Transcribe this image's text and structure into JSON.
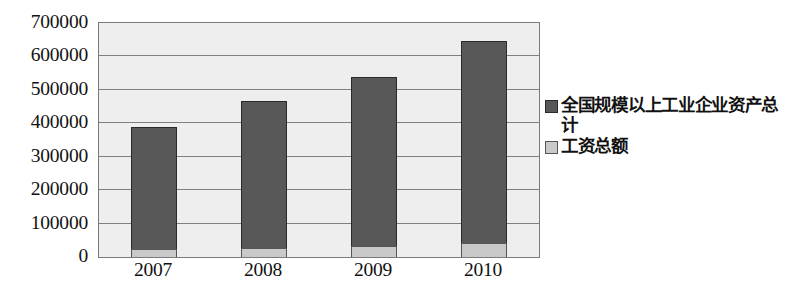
{
  "chart_data": {
    "type": "bar",
    "subtype": "stacked-column",
    "title": "",
    "subtitle": "",
    "xlabel": "",
    "ylabel": "",
    "categories": [
      "2007",
      "2008",
      "2009",
      "2010"
    ],
    "series": [
      {
        "name": "工资总额",
        "color": "#c9c9c9",
        "values": [
          24000,
          27000,
          33000,
          42000
        ]
      },
      {
        "name": "全国规模以上工业企业资产总计",
        "color": "#585858",
        "values": [
          365000,
          440000,
          505000,
          604000
        ]
      }
    ],
    "stack_totals": [
      389000,
      467000,
      538000,
      646000
    ],
    "ylim": [
      0,
      700000
    ],
    "ytick_values": [
      0,
      100000,
      200000,
      300000,
      400000,
      500000,
      600000,
      700000
    ],
    "ytick_labels": [
      "0",
      "100000",
      "200000",
      "300000",
      "400000",
      "500000",
      "600000",
      "700000"
    ],
    "grid": true,
    "grid_axis": "y",
    "legend_position": "right",
    "legend_entries": [
      "全国规模以上工业企业资产总计",
      "工资总额"
    ],
    "plot_background": "#eeeeee",
    "frame_color": "#7a7a7a",
    "gridline_color": "#808080"
  },
  "axes": {
    "y_ticks": [
      {
        "label": "700000",
        "value": 700000
      },
      {
        "label": "600000",
        "value": 600000
      },
      {
        "label": "500000",
        "value": 500000
      },
      {
        "label": "400000",
        "value": 400000
      },
      {
        "label": "300000",
        "value": 300000
      },
      {
        "label": "200000",
        "value": 200000
      },
      {
        "label": "100000",
        "value": 100000
      },
      {
        "label": "0",
        "value": 0
      }
    ],
    "x_ticks": [
      {
        "label": "2007"
      },
      {
        "label": "2008"
      },
      {
        "label": "2009"
      },
      {
        "label": "2010"
      }
    ]
  },
  "legend": {
    "items": [
      {
        "label": "全国规模以上工业企业资产总计",
        "color": "#585858"
      },
      {
        "label": "工资总额",
        "color": "#c9c9c9"
      }
    ]
  }
}
